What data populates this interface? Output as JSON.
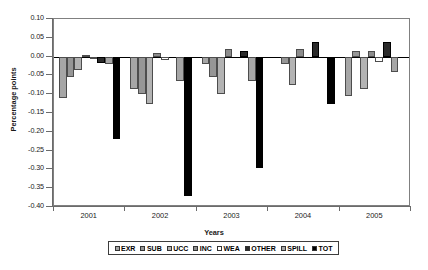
{
  "chart_data": {
    "type": "bar",
    "title": "",
    "xlabel": "Years",
    "ylabel": "Percentage points",
    "categories": [
      "2001",
      "2002",
      "2003",
      "2004",
      "2005"
    ],
    "ylim": [
      -0.4,
      0.1
    ],
    "ytick_values": [
      0.1,
      0.05,
      0.0,
      -0.05,
      -0.1,
      -0.15,
      -0.2,
      -0.25,
      -0.3,
      -0.35,
      -0.4
    ],
    "ytick_labels": [
      "0.10",
      "0.05",
      "0.00",
      "-0.05",
      "-0.10",
      "-0.15",
      "-0.20",
      "-0.25",
      "-0.30",
      "-0.35",
      "-0.40"
    ],
    "grid": false,
    "legend_position": "bottom",
    "series": [
      {
        "name": "EXR",
        "color": "#a6a6a6",
        "values": [
          -0.11,
          -0.085,
          -0.02,
          0.0,
          -0.105
        ]
      },
      {
        "name": "SUB",
        "color": "#969696",
        "values": [
          -0.055,
          -0.1,
          -0.055,
          -0.02,
          0.015
        ]
      },
      {
        "name": "UCC",
        "color": "#b3b3b3",
        "values": [
          -0.035,
          -0.125,
          -0.1,
          -0.075,
          -0.085
        ]
      },
      {
        "name": "INC",
        "color": "#8c8c8c",
        "values": [
          0.005,
          0.01,
          0.02,
          0.02,
          0.015
        ]
      },
      {
        "name": "WEA",
        "color": "#ffffff",
        "values": [
          -0.002,
          -0.008,
          0.0,
          0.0,
          -0.015
        ]
      },
      {
        "name": "OTHER",
        "color": "#2b2b2b",
        "values": [
          -0.018,
          0.0,
          0.015,
          0.04,
          0.04
        ]
      },
      {
        "name": "SPILL",
        "color": "#a6a6a6",
        "values": [
          -0.02,
          -0.065,
          -0.065,
          0.0,
          -0.04
        ]
      },
      {
        "name": "TOT",
        "color": "#000000",
        "values": [
          -0.22,
          -0.37,
          -0.295,
          -0.125,
          0.0
        ]
      }
    ]
  },
  "legend": {
    "items": [
      {
        "label": "EXR"
      },
      {
        "label": "SUB"
      },
      {
        "label": "UCC"
      },
      {
        "label": "INC"
      },
      {
        "label": "WEA"
      },
      {
        "label": "OTHER"
      },
      {
        "label": "SPILL"
      },
      {
        "label": "TOT"
      }
    ]
  }
}
